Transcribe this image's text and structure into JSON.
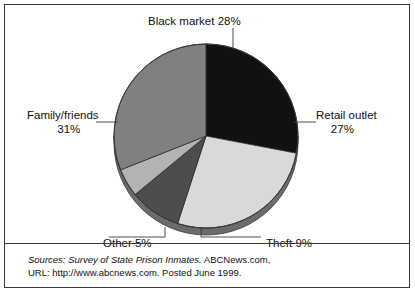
{
  "figure": {
    "background_color": "#ffffff",
    "frame_color": "#3a3a3a"
  },
  "chart_data": {
    "type": "pie",
    "title": "",
    "subtitle": "",
    "xlabel": "",
    "ylabel": "",
    "legend_position": "none",
    "labels_placement": "callout-with-leader-lines",
    "start_angle_deg": 0,
    "direction": "clockwise",
    "total_percent": 100,
    "categories": [
      "Black market",
      "Retail outlet",
      "Theft",
      "Other",
      "Family/friends"
    ],
    "values": [
      28,
      27,
      9,
      5,
      31
    ],
    "value_unit": "%",
    "slices": [
      {
        "name": "Black market",
        "label": "Black market 28%",
        "value": 28,
        "value_text": "28%",
        "color": "#111111",
        "start_deg": 0,
        "end_deg": 100.8
      },
      {
        "name": "Retail outlet",
        "label": "Retail outlet",
        "value": 27,
        "value_text": "27%",
        "color": "#d9d9d9",
        "start_deg": 100.8,
        "end_deg": 198.0
      },
      {
        "name": "Theft",
        "label": "Theft 9%",
        "value": 9,
        "value_text": "9%",
        "color": "#4d4d4d",
        "start_deg": 198.0,
        "end_deg": 230.4
      },
      {
        "name": "Other",
        "label": "Other 5%",
        "value": 5,
        "value_text": "5%",
        "color": "#b3b3b3",
        "start_deg": 230.4,
        "end_deg": 248.4
      },
      {
        "name": "Family/friends",
        "label": "Family/friends",
        "value": 31,
        "value_text": "31%",
        "color": "#808080",
        "start_deg": 248.4,
        "end_deg": 360.0
      }
    ]
  },
  "callouts": {
    "black_market": {
      "text": "Black market 28%"
    },
    "retail_outlet": {
      "name": "Retail outlet",
      "percent": "27%"
    },
    "family_friends": {
      "name": "Family/friends",
      "percent": "31%"
    },
    "other": {
      "text": "Other 5%"
    },
    "theft": {
      "text": "Theft 9%"
    }
  },
  "sources": {
    "prefix": "Sources: Survey of State Prison Inmates.",
    "line_1_rest": " ABCNews.com,",
    "line_2": "URL: http://www.abcnews.com. Posted June 1999."
  }
}
